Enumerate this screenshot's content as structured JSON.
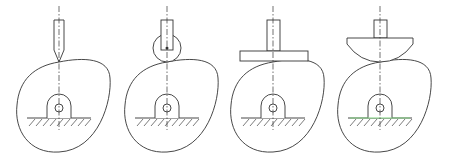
{
  "diagram": {
    "colors": {
      "stroke": "#333333",
      "background": "#ffffff",
      "highlight": "#7fd07f",
      "accent": "#a070c0"
    },
    "panels": [
      {
        "name": "knife-edge-follower",
        "label": "Knife-edge follower",
        "cx": 59
      },
      {
        "name": "roller-follower",
        "label": "Roller follower",
        "cx": 167
      },
      {
        "name": "flat-faced-follower",
        "label": "Flat-faced follower",
        "cx": 273
      },
      {
        "name": "mushroom-follower",
        "label": "Spherical (mushroom) follower",
        "cx": 380
      }
    ]
  }
}
